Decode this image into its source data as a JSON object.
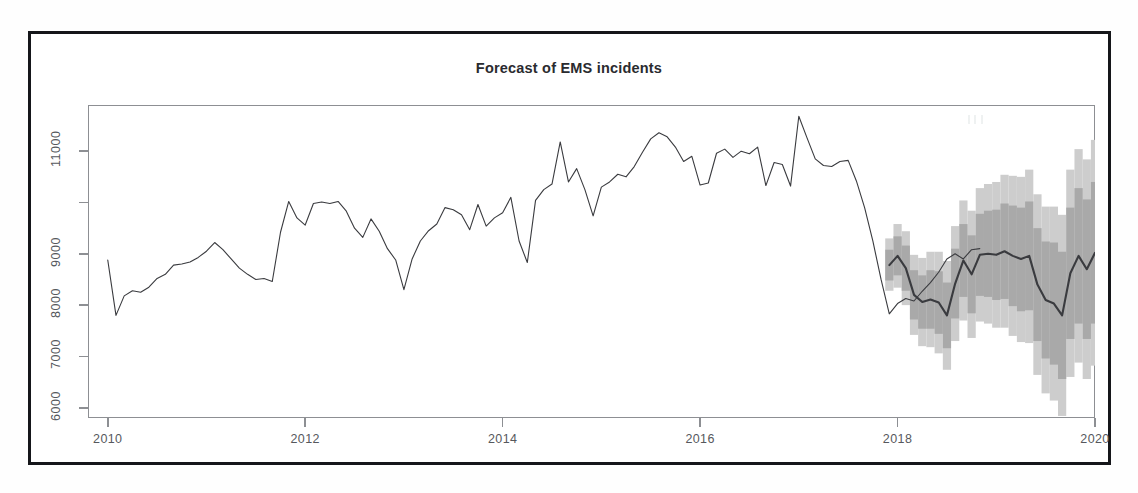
{
  "chart_data": {
    "type": "line",
    "title": "Forecast of EMS incidents",
    "subtitle": "",
    "xlabel": "",
    "ylabel": "",
    "xlim": [
      2009.8,
      2020.0
    ],
    "ylim": [
      5800,
      11900
    ],
    "grid": false,
    "legend_position": "none",
    "x_ticks": [
      2010,
      2012,
      2014,
      2016,
      2018,
      2020
    ],
    "x_tick_labels": [
      "2010",
      "2012",
      "2014",
      "2016",
      "2018",
      "2020"
    ],
    "y_ticks": [
      6000,
      7000,
      8000,
      9000,
      10000,
      11000
    ],
    "y_tick_labels": [
      "6000",
      "7000",
      "8000",
      "9000",
      "",
      "11000"
    ],
    "series": [
      {
        "name": "Observed EMS incidents",
        "type": "line",
        "color": "#3a3b3f",
        "x_start": 2010.0,
        "x_step": 0.08333,
        "values": [
          8880,
          7800,
          8180,
          8280,
          8250,
          8350,
          8520,
          8600,
          8780,
          8800,
          8840,
          8930,
          9050,
          9220,
          9080,
          8900,
          8720,
          8600,
          8500,
          8520,
          8460,
          9420,
          10020,
          9700,
          9560,
          9980,
          10010,
          9980,
          10020,
          9830,
          9500,
          9320,
          9680,
          9440,
          9100,
          8880,
          8300,
          8900,
          9250,
          9450,
          9580,
          9900,
          9860,
          9760,
          9470,
          9960,
          9540,
          9700,
          9800,
          10100,
          9250,
          8830,
          10040,
          10250,
          10360,
          11180,
          10400,
          10660,
          10250,
          9740,
          10300,
          10400,
          10550,
          10500,
          10700,
          10980,
          11240,
          11360,
          11280,
          11080,
          10800,
          10900,
          10340,
          10380,
          10960,
          11040,
          10880,
          11000,
          10950,
          11080,
          10330,
          10780,
          10740,
          10320,
          11680,
          11260,
          10850,
          10720,
          10700,
          10800,
          10820,
          10420,
          9900,
          9250,
          8500,
          7830,
          8030,
          8130,
          8080,
          8270,
          8440,
          8640,
          8900,
          9000,
          8900,
          9080,
          9100
        ]
      },
      {
        "name": "Forecast (point estimate)",
        "type": "line",
        "color": "#3a3b3f",
        "x_start": 2017.917,
        "x_step": 0.08333,
        "values": [
          8780,
          8960,
          8720,
          8200,
          8060,
          8110,
          8050,
          7800,
          8420,
          8870,
          8600,
          8980,
          9000,
          8980,
          9050,
          8960,
          8900,
          8960,
          8400,
          8100,
          8030,
          7800,
          8620,
          8960,
          8700,
          9020,
          9000,
          8990,
          9030
        ]
      }
    ],
    "intervals": [
      {
        "name": "95% prediction interval",
        "level": 95,
        "color": "#cdcdcd",
        "lower": [
          8280,
          8340,
          8000,
          7420,
          7200,
          7180,
          7060,
          6740,
          7300,
          7700,
          7360,
          7680,
          7640,
          7560,
          7560,
          7400,
          7280,
          7260,
          6640,
          6280,
          6140,
          5840,
          6600,
          6880,
          6560,
          6820,
          6740,
          6660,
          6640
        ],
        "upper": [
          9300,
          9580,
          9440,
          8980,
          8920,
          9040,
          9040,
          8860,
          9540,
          10040,
          9840,
          10280,
          10360,
          10400,
          10540,
          10520,
          10500,
          10640,
          10160,
          9920,
          9920,
          9760,
          10640,
          11040,
          10840,
          11220,
          11260,
          11320,
          11420
        ]
      },
      {
        "name": "80% prediction interval",
        "level": 80,
        "color": "#a9a9a9",
        "lower": [
          8480,
          8580,
          8280,
          7720,
          7540,
          7540,
          7440,
          7160,
          7740,
          8160,
          7840,
          8180,
          8160,
          8100,
          8120,
          7980,
          7880,
          7900,
          7300,
          6960,
          6840,
          6560,
          7340,
          7640,
          7340,
          7640,
          7580,
          7520,
          7520
        ],
        "upper": [
          9080,
          9340,
          9160,
          8680,
          8580,
          8680,
          8660,
          8440,
          9100,
          9580,
          9360,
          9780,
          9840,
          9860,
          9980,
          9940,
          9900,
          10020,
          9500,
          9240,
          9220,
          9040,
          9900,
          10280,
          10060,
          10400,
          10420,
          10460,
          10540
        ]
      }
    ]
  },
  "axes": {
    "y_labels": [
      "11000",
      "9000",
      "8000",
      "7000",
      "6000"
    ],
    "x_labels": [
      "2010",
      "2012",
      "2014",
      "2016",
      "2018",
      "2020"
    ]
  },
  "colors": {
    "line": "#3a3b3f",
    "interval_80": "#a9a9a9",
    "interval_95": "#cdcdcd",
    "axis": "#8d8f93",
    "frame": "#15161a",
    "title": "#2a2b2f"
  }
}
